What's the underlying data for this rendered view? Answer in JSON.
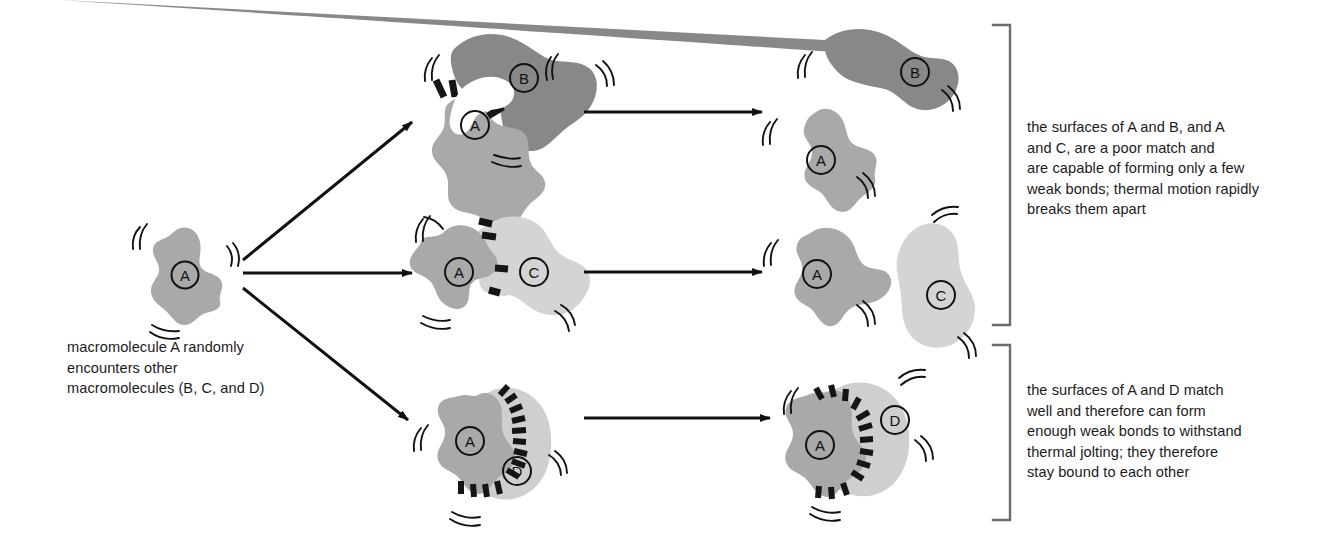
{
  "figure": {
    "type": "molecular-binding-diagram",
    "title": "",
    "colors": {
      "molecule_a": "#a9a9a9",
      "molecule_b": "#888888",
      "molecule_c": "#d4d4d4",
      "molecule_d": "#cfcfcf",
      "bond": "#1a1a1a",
      "outline": "#111111",
      "arrow": "#111111",
      "bracket": "#6b6b6b",
      "background": "#ffffff",
      "text": "#1b1b1b"
    }
  },
  "captions": {
    "left": "macromolecule A randomly\nencounters other\nmacromolecules (B, C, and D)",
    "top_right": "the surfaces of A and B, and A\nand C, are a poor match and\nare capable of forming only a few\nweak bonds; thermal motion rapidly\nbreaks them apart",
    "bottom_right": "the surfaces of A and D match\nwell and therefore can form\nenough weak bonds to withstand\nthermal jolting; they therefore\nstay bound to each other"
  },
  "molecules": {
    "a": {
      "label": "A",
      "shade": "medium-gray"
    },
    "b": {
      "label": "B",
      "shade": "dark-gray"
    },
    "c": {
      "label": "C",
      "shade": "light-gray"
    },
    "d": {
      "label": "D",
      "shade": "light-gray"
    }
  },
  "labels": {
    "a_start": "A",
    "ab_a": "A",
    "ab_b": "B",
    "ac_a": "A",
    "ac_c": "C",
    "ad_a": "A",
    "ad_d": "D",
    "sep_ab_a": "A",
    "sep_ab_b": "B",
    "sep_ac_a": "A",
    "sep_ac_c": "C",
    "bound_ad_a": "A",
    "bound_ad_d": "D"
  },
  "rows": [
    {
      "id": "row-ab",
      "complex": "A-B complex",
      "bond_count": 3,
      "outcome": "breaks apart",
      "result": "A and B separated"
    },
    {
      "id": "row-ac",
      "complex": "A-C complex",
      "bond_count": 4,
      "outcome": "breaks apart",
      "result": "A and C separated"
    },
    {
      "id": "row-ad",
      "complex": "A-D complex",
      "bond_count": 13,
      "outcome": "stays bound",
      "result": "A-D remain bound"
    }
  ],
  "arrows": {
    "fan_up": "encounter B",
    "fan_mid": "encounter C",
    "fan_down": "encounter D",
    "row1_result": "dissociation",
    "row2_result": "dissociation",
    "row3_result": "stable binding"
  },
  "brackets": {
    "top": "groups rows A-B and A-C",
    "bottom": "groups row A-D"
  }
}
